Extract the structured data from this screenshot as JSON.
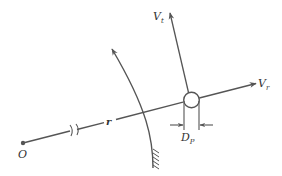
{
  "diagram": {
    "type": "particle-velocity-sketch",
    "colors": {
      "stroke": "#555555",
      "text": "#333333",
      "background": "#ffffff"
    },
    "labels": {
      "origin": "O",
      "radius": "r",
      "tangential_velocity": {
        "main": "V",
        "sub": "t"
      },
      "radial_velocity": {
        "main": "V",
        "sub": "r"
      },
      "particle_diameter": {
        "main": "D",
        "sub": "P"
      }
    },
    "elements": [
      "origin-point",
      "radial-line-with-break",
      "curved-flow-arrow-with-wall-hatch",
      "particle-circle",
      "tangential-velocity-arrow",
      "radial-velocity-arrow",
      "diameter-dimension"
    ]
  }
}
